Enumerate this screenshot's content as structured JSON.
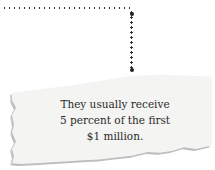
{
  "callout": {
    "lines": [
      "They usually receive",
      "5 percent of the first",
      "$1 million."
    ]
  },
  "colors": {
    "paper": "#f4f4f2",
    "text": "#2a2a2a",
    "dots": "#333333"
  }
}
